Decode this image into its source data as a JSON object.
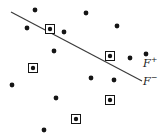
{
  "figure": {
    "name": "linear-separator-scatter-plot",
    "width": 168,
    "height": 139,
    "background_color": "#ffffff"
  },
  "labels": {
    "positive_region": "F",
    "positive_sign": "+",
    "negative_region": "F",
    "negative_sign": "−",
    "positive_x": 143,
    "positive_y": 58,
    "negative_x": 143,
    "negative_y": 76
  },
  "separator_line": {
    "name": "decision-boundary",
    "color": "#3b3b3b",
    "width": 1.2,
    "x1": 11,
    "y1": 12,
    "x2": 142,
    "y2": 81
  },
  "chart_data": {
    "type": "scatter",
    "title": "",
    "xlabel": "",
    "ylabel": "",
    "xlim": [
      0,
      168
    ],
    "ylim": [
      0,
      139
    ],
    "grid": false,
    "legend": false,
    "annotations": [
      {
        "text": "F+",
        "x": 143,
        "y": 64
      },
      {
        "text": "F-",
        "x": 143,
        "y": 82
      }
    ],
    "series": [
      {
        "name": "plain-points",
        "marker": "filled-circle",
        "color": "#151515",
        "radius": 2.4,
        "points": [
          {
            "x": 35,
            "y": 10
          },
          {
            "x": 86,
            "y": 13
          },
          {
            "x": 27,
            "y": 28
          },
          {
            "x": 64,
            "y": 32
          },
          {
            "x": 117,
            "y": 26
          },
          {
            "x": 54,
            "y": 51
          },
          {
            "x": 146,
            "y": 54
          },
          {
            "x": 130,
            "y": 58
          },
          {
            "x": 91,
            "y": 78
          },
          {
            "x": 12,
            "y": 85
          },
          {
            "x": 114,
            "y": 80
          },
          {
            "x": 56,
            "y": 98
          },
          {
            "x": 44,
            "y": 130
          }
        ]
      },
      {
        "name": "boxed-points",
        "marker": "square-outlined-circle",
        "color": "#151515",
        "box_size": 9,
        "radius": 2.2,
        "points": [
          {
            "x": 50,
            "y": 29
          },
          {
            "x": 110,
            "y": 56
          },
          {
            "x": 33,
            "y": 68
          },
          {
            "x": 110,
            "y": 100
          },
          {
            "x": 76,
            "y": 119
          }
        ]
      }
    ]
  }
}
